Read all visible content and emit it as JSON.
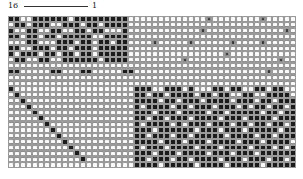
{
  "figure": {
    "label_left": "16",
    "label_right": "1",
    "grid_cols": 48,
    "grid_rows": 26,
    "legend": {
      "0": "empty cell",
      "1": "filled cell",
      "2": "crossed cell"
    },
    "rows": [
      "110011111101111111110000000000000200000000200000",
      "011011100111011011110000000000000000000000000000",
      "100110011001101100010000000000002000000000000020",
      "110110110111110011110000000000000000000000000000",
      "000110001110110110110000200000200000020000200000",
      "110011101101110111110000000000000000000000000000",
      "101110110110110111110000000000000000200000000000",
      "011001100111111011110000000002000000000000000200",
      "000000000000000000000000000000000000000000000000",
      "110000011000110000011000000000000000000000020000",
      "000000000000000000000000000000000000000000000000",
      "000000000000000000000000000000000000000000000000",
      "100000000000000000000111001110100011011001101100",
      "010000000000000000000110110111101101100110011110",
      "001000000000000000000111101101110111101110110111",
      "000100000000000000000101111011011101110101101101",
      "000010000000000000000111011101111011011111011011",
      "000001000000000000000110110111011110111011110111",
      "000000100000000000000101111010111011101101101101",
      "000000010000000000000111011111101110111011111011",
      "000000001000000000000110111011011111011110110111",
      "000000000100000000000111101110111011110111011110",
      "000000000010000000000101110111101110111101110101",
      "000000000001000000000111011101111011101110111111",
      "000000000000100000000110111011011110111011101101",
      "000000000000000000000111101111101111011111011111"
    ]
  }
}
